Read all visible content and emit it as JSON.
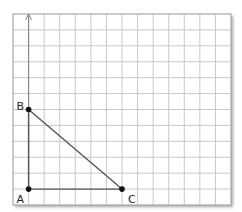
{
  "diagram": {
    "type": "grid-triangle",
    "grid": {
      "columns": 14,
      "rows": 12
    },
    "axis": {
      "has_arrow": true
    },
    "points": [
      {
        "name": "A",
        "gx": 1,
        "gy": 11
      },
      {
        "name": "B",
        "gx": 1,
        "gy": 6
      },
      {
        "name": "C",
        "gx": 7,
        "gy": 11
      }
    ],
    "segments": [
      [
        "A",
        "B"
      ],
      [
        "B",
        "C"
      ],
      [
        "A",
        "C"
      ]
    ],
    "colors": {
      "grid": "#c8c8c8",
      "border": "#a8a8a8",
      "line": "#555555",
      "point": "#111111"
    }
  }
}
